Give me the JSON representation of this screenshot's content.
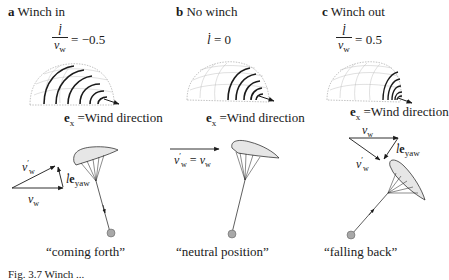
{
  "figure": {
    "caption_fragment": "Fig. 3.7  Winch ..."
  },
  "panels": [
    {
      "id": "a",
      "letter": "a",
      "title": "Winch in",
      "equation": {
        "numerator": "l̇",
        "denominator": "v",
        "denominator_sub": "w",
        "rhs": "= −0.5"
      },
      "direction_label": {
        "vec": "e",
        "sub": "x",
        "text": " =Wind direction"
      },
      "vectors": {
        "v_w": {
          "sym": "v",
          "sub": "w"
        },
        "v_w_prime": {
          "sym": "v",
          "sup": "′",
          "sub": "w"
        },
        "l_eyaw": {
          "l": "l̇",
          "vec": "e",
          "sub": "yaw"
        }
      },
      "state_label": "“coming forth”"
    },
    {
      "id": "b",
      "letter": "b",
      "title": "No winch",
      "equation": {
        "lhs": "l̇",
        "rhs": " = 0"
      },
      "direction_label": {
        "vec": "e",
        "sub": "x",
        "text": " =Wind direction"
      },
      "vectors": {
        "v_w_eq": {
          "left": "v",
          "left_sup": "′",
          "left_sub": "w",
          "mid": " = ",
          "right": "v",
          "right_sub": "w"
        }
      },
      "state_label": "“neutral position”"
    },
    {
      "id": "c",
      "letter": "c",
      "title": "Winch out",
      "equation": {
        "numerator": "l̇",
        "denominator": "v",
        "denominator_sub": "w",
        "rhs": "= 0.5"
      },
      "direction_label": {
        "vec": "e",
        "sub": "x",
        "text": " =Wind direction"
      },
      "vectors": {
        "v_w": {
          "sym": "v",
          "sub": "w"
        },
        "v_w_prime": {
          "sym": "v",
          "sup": "′",
          "sub": "w"
        },
        "l_eyaw": {
          "l": "l̇",
          "vec": "e",
          "sub": "yaw"
        }
      },
      "state_label": "“falling back”"
    }
  ],
  "colors": {
    "ink": "#1a1a1a",
    "kite_fill": "#e6e6e6",
    "ground_station": "#a8a8a8",
    "wind_window_grid": "#9a9a9a",
    "trajectory": "#222222"
  }
}
